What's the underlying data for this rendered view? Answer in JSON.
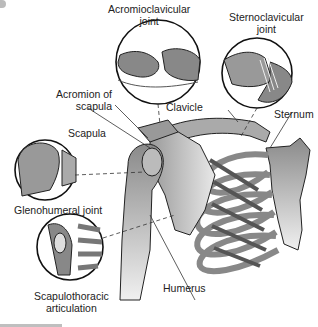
{
  "diagram": {
    "labels": {
      "acromioclavicular": "Acromioclavicular joint",
      "acromioclavicular_l1": "Acromioclavicular",
      "acromioclavicular_l2": "joint",
      "sternoclavicular_l1": "Sternoclavicular",
      "sternoclavicular_l2": "joint",
      "acromion_l1": "Acromion of",
      "acromion_l2": "scapula",
      "clavicle": "Clavicle",
      "sternum": "Sternum",
      "scapula": "Scapula",
      "glenohumeral": "Glenohumeral joint",
      "scapulothoracic_l1": "Scapulothoracic",
      "scapulothoracic_l2": "articulation",
      "humerus": "Humerus"
    },
    "colors": {
      "bone": "#8c8c8c",
      "bone_light": "#d9d9d9",
      "outline": "#1a1a1a",
      "background": "#ffffff"
    }
  }
}
